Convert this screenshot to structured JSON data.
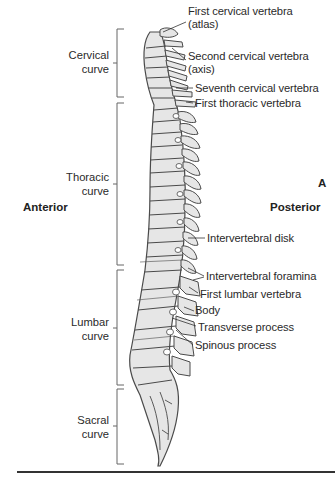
{
  "figure": {
    "panel_letter": "A",
    "orientation": {
      "left": "Anterior",
      "right": "Posterior"
    },
    "curves": [
      {
        "line1": "Cervical",
        "line2": "curve"
      },
      {
        "line1": "Thoracic",
        "line2": "curve"
      },
      {
        "line1": "Lumbar",
        "line2": "curve"
      },
      {
        "line1": "Sacral",
        "line2": "curve"
      }
    ],
    "labels": [
      {
        "line1": "First cervical vertebra",
        "line2": "(atlas)"
      },
      {
        "line1": "Second cervical vertebra",
        "line2": "(axis)"
      },
      {
        "line1": "Seventh cervical vertebra"
      },
      {
        "line1": "First thoracic vertebra"
      },
      {
        "line1": "Intervertebral disk"
      },
      {
        "line1": "Intervertebral foramina"
      },
      {
        "line1": "First lumbar vertebra"
      },
      {
        "line1": "Body"
      },
      {
        "line1": "Transverse process"
      },
      {
        "line1": "Spinous process"
      }
    ],
    "colors": {
      "bone_fill": "#e6e6e6",
      "bone_stroke": "#4a4a4a",
      "text": "#2a2a2a",
      "background": "#ffffff"
    }
  }
}
